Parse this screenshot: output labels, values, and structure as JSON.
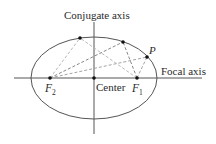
{
  "labels": {
    "conjugate_axis": "Conjugate axis",
    "focal_axis": "Focal axis",
    "center": "Center",
    "f1": "F",
    "f1_sub": "1",
    "f2": "F",
    "f2_sub": "2",
    "p": "P"
  },
  "colors": {
    "ellipse": "#555555",
    "axes": "#555555",
    "dashed_light": "#b0b0b0",
    "dashed_dark": "#777777",
    "points": "#111111"
  },
  "geometry": {
    "center": [
      94,
      78
    ],
    "rx": 63,
    "ry": 41,
    "f1": [
      137,
      78
    ],
    "f2": [
      50,
      78
    ],
    "points_on_ellipse": [
      [
        80,
        38
      ],
      [
        123,
        42
      ],
      [
        147,
        57
      ]
    ]
  }
}
